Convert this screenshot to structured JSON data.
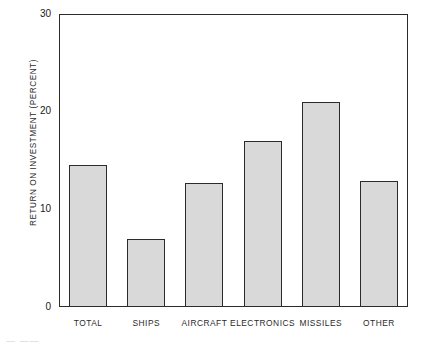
{
  "chart_data": {
    "type": "bar",
    "title": "",
    "xlabel": "",
    "ylabel": "RETURN ON INVESTMENT (PERCENT)",
    "categories": [
      "TOTAL",
      "SHIPS",
      "AIRCRAFT",
      "ELECTRONICS",
      "MISSILES",
      "OTHER"
    ],
    "values": [
      14.5,
      7.0,
      12.7,
      17.0,
      21.0,
      12.9
    ],
    "ylim": [
      0,
      30
    ],
    "yticks": [
      0,
      10,
      20,
      30
    ],
    "ytick_labels": [
      "0",
      "10",
      "20",
      "30"
    ],
    "grid": false,
    "legend": null,
    "bar_fill_color": "#d9d9d9",
    "bar_edge_color": "#2b2b2b",
    "background_color": "#ffffff"
  },
  "figure": {
    "caption_fragment": "—  ——"
  }
}
